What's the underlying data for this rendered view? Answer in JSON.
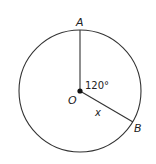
{
  "diagram": {
    "type": "circle-geometry",
    "center": {
      "label": "O",
      "x": 80,
      "y": 91
    },
    "radius": 61,
    "points": [
      {
        "label": "A",
        "x": 80,
        "y": 30
      },
      {
        "label": "B",
        "x": 133,
        "y": 122
      }
    ],
    "angle": {
      "label": "120°",
      "vertex": "O",
      "between": [
        "A",
        "B"
      ]
    },
    "segment_label": "x",
    "colors": {
      "stroke": "#333333",
      "dot": "#111111",
      "text": "#222222"
    }
  }
}
